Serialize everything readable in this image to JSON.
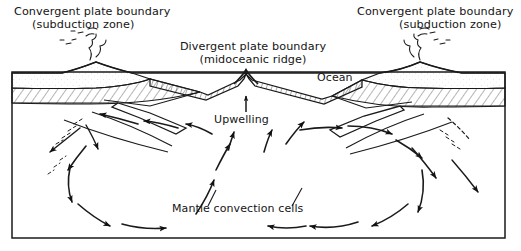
{
  "figure": {
    "type": "geology-cross-section-diagram",
    "title_visible": false,
    "frame": {
      "x": 12,
      "y": 72,
      "width": 493,
      "height": 166,
      "stroke": "#1a1a1a"
    },
    "colors": {
      "ink": "#1a1a1a",
      "background": "#ffffff",
      "hatch": "#2a2a2a"
    }
  },
  "labels": {
    "left_boundary_line1": "Convergent plate boundary",
    "left_boundary_line2": "(subduction zone)",
    "right_boundary_line1": "Convergent plate boundary",
    "right_boundary_line2": "(subduction zone)",
    "divergent_line1": "Divergent plate boundary",
    "divergent_line2": "(midoceanic ridge)",
    "ocean": "Ocean",
    "upwelling": "Upwelling",
    "mantle": "Mantle convection cells"
  },
  "features": {
    "left_volcano": {
      "name": "volcano-with-ash-plume",
      "side": "left"
    },
    "right_volcano": {
      "name": "volcano-with-ash-plume",
      "side": "right"
    },
    "midocean_ridge": {
      "name": "midoceanic-ridge-peak",
      "center_x": 246
    },
    "oceanic_crust": {
      "name": "hatched-oceanic-crust-band"
    },
    "continental_crust_left": {
      "name": "hatched-continental-crust-left"
    },
    "continental_crust_right": {
      "name": "hatched-continental-crust-right"
    },
    "subducting_slab_left": {
      "name": "subducting-slab-left",
      "direction": "down-left"
    },
    "subducting_slab_right": {
      "name": "subducting-slab-right",
      "direction": "down-right"
    }
  },
  "convection_cells": [
    {
      "name": "left-mantle-convection-cell",
      "rotation": "clockwise",
      "top_flow": "right-to-left (toward subduction zone)",
      "bottom_flow": "left-to-right (toward ridge)"
    },
    {
      "name": "right-mantle-convection-cell",
      "rotation": "counter-clockwise",
      "top_flow": "left-to-right (toward subduction zone)",
      "bottom_flow": "right-to-left (toward ridge)"
    }
  ]
}
